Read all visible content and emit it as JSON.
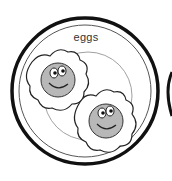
{
  "illustration": {
    "subject": "plate of two fried eggs with smiling faces",
    "label": "eggs",
    "colors": {
      "outline": "#111111",
      "yolk": "#b8b8b8",
      "white": "#ffffff",
      "inner_ring": "#777777"
    },
    "egg_count": 2
  }
}
